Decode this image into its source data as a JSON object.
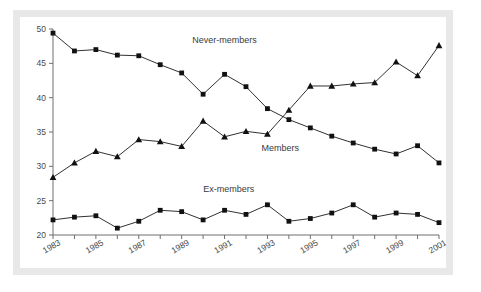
{
  "figure": {
    "background_color": "#ffffff",
    "frame_color": "#e8e8e8",
    "axis_color": "#6e6e6e",
    "series_color": "#111111"
  },
  "chart_data": {
    "type": "line",
    "title": "",
    "subtitle": "",
    "xlabel": "",
    "ylabel": "",
    "xlim": [
      1983,
      2001
    ],
    "ylim": [
      20,
      50
    ],
    "grid": false,
    "legend_position": "inline-annotation",
    "x": [
      1983,
      1984,
      1985,
      1986,
      1987,
      1988,
      1989,
      1990,
      1991,
      1992,
      1993,
      1994,
      1995,
      1996,
      1997,
      1998,
      1999,
      2000,
      2001
    ],
    "x_tick_labels": [
      "1983",
      "1985",
      "1987",
      "1989",
      "1991",
      "1993",
      "1995",
      "1997",
      "1999",
      "2001"
    ],
    "x_tick_values": [
      1983,
      1985,
      1987,
      1989,
      1991,
      1993,
      1995,
      1997,
      1999,
      2001
    ],
    "y_tick_labels": [
      "20",
      "25",
      "30",
      "35",
      "40",
      "45",
      "50"
    ],
    "y_tick_values": [
      20,
      25,
      30,
      35,
      40,
      45,
      50
    ],
    "series": [
      {
        "name": "Never-members",
        "marker": "square",
        "annotation": "Never-members",
        "annotation_x": 1991.0,
        "annotation_y": 48.0,
        "values": [
          49.4,
          46.8,
          47.0,
          46.2,
          46.1,
          44.8,
          43.6,
          40.5,
          43.4,
          41.6,
          38.4,
          36.8,
          35.6,
          34.4,
          33.4,
          32.5,
          31.8,
          33.0,
          30.5
        ]
      },
      {
        "name": "Members",
        "marker": "triangle",
        "annotation": "Members",
        "annotation_x": 1993.6,
        "annotation_y": 32.2,
        "values": [
          28.4,
          30.5,
          32.2,
          31.4,
          33.9,
          33.6,
          32.9,
          36.6,
          34.3,
          35.1,
          34.7,
          38.2,
          41.7,
          41.7,
          42.0,
          42.2,
          45.2,
          43.2,
          47.6
        ]
      },
      {
        "name": "Ex-members",
        "marker": "square",
        "annotation": "Ex-members",
        "annotation_x": 1991.2,
        "annotation_y": 26.2,
        "values": [
          22.2,
          22.6,
          22.8,
          21.0,
          22.0,
          23.6,
          23.4,
          22.2,
          23.6,
          23.0,
          24.4,
          22.0,
          22.4,
          23.2,
          24.4,
          22.6,
          23.2,
          23.0,
          21.8
        ]
      }
    ]
  }
}
